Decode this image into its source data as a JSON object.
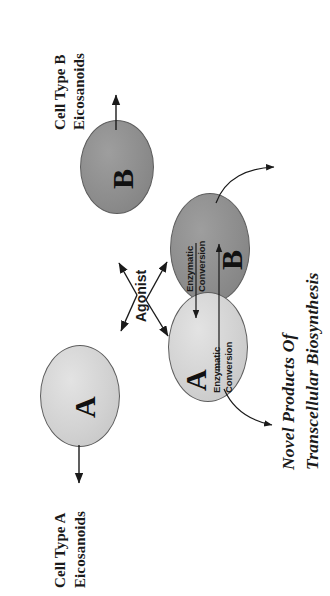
{
  "figure": {
    "kind": "scientific-diagram",
    "orientation": "rotated-90-ccw",
    "background_color": "#ffffff",
    "ink_color": "#1a1a1a"
  },
  "left_panel": {
    "cell_b": {
      "letter": "B",
      "fill_color": "#8d8d8d",
      "output_label_line1": "Cell Type B",
      "output_label_line2": "Eicosanoids"
    },
    "cell_a": {
      "letter": "A",
      "fill_color": "#d2d2d2",
      "output_label_line1": "Cell Type A",
      "output_label_line2": "Eicosanoids"
    },
    "stimulus": {
      "label": "Agonist"
    }
  },
  "right_panel": {
    "cell_b": {
      "letter": "B",
      "fill_color": "#8d8d8d",
      "conversion_label_line1": "Enzymatic",
      "conversion_label_line2": "Conversion"
    },
    "cell_a": {
      "letter": "A",
      "fill_color": "#d2d2d2",
      "conversion_label_line1": "Enzymatic",
      "conversion_label_line2": "Conversion"
    },
    "title_line1": "Novel Products Of",
    "title_line2": "Transcellular Biosynthesis"
  }
}
